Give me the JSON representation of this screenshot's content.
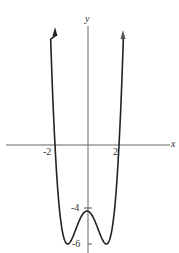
{
  "chart_data": {
    "type": "line",
    "title": "",
    "xlabel": "x",
    "ylabel": "y",
    "function": "f(x) = a x^4 + b x^2 - 4, with roots at x = -2, 2 and local max -4 at x = 0, minima -6",
    "x_ticks": [
      {
        "value": -2,
        "label": "-2"
      },
      {
        "value": 2,
        "label": "2"
      }
    ],
    "y_ticks": [
      {
        "value": -4,
        "label": "-4"
      },
      {
        "value": -6,
        "label": "-6"
      }
    ],
    "key_points": [
      {
        "x": -2,
        "y": 0,
        "note": "x-intercept"
      },
      {
        "x": 2,
        "y": 0,
        "note": "x-intercept"
      },
      {
        "x": 0,
        "y": -4,
        "note": "local maximum / y-intercept"
      },
      {
        "x": -1.21,
        "y": -6,
        "note": "local minimum"
      },
      {
        "x": 1.21,
        "y": -6,
        "note": "local minimum"
      }
    ],
    "series": [
      {
        "name": "f(x)",
        "x": [
          -2.25,
          -2,
          -1.75,
          -1.5,
          -1.21,
          -1,
          -0.5,
          0,
          0.5,
          1,
          1.21,
          1.5,
          1.75,
          2,
          2.25
        ],
        "values": [
          6.9,
          0,
          -4.3,
          -5.7,
          -6,
          -5.8,
          -4.6,
          -4,
          -4.6,
          -5.8,
          -6,
          -5.7,
          -4.3,
          0,
          6.9
        ]
      }
    ],
    "arrows": "both ends of curve extend upward with arrowheads",
    "grid": false,
    "legend": "none",
    "colors": {
      "curve": "#222222",
      "axes": "#555555"
    }
  },
  "labels": {
    "x_axis": "x",
    "y_axis": "y",
    "x_tick_neg2": "-2",
    "x_tick_2": "2",
    "y_tick_neg4": "-4",
    "y_tick_neg6": "-6"
  }
}
